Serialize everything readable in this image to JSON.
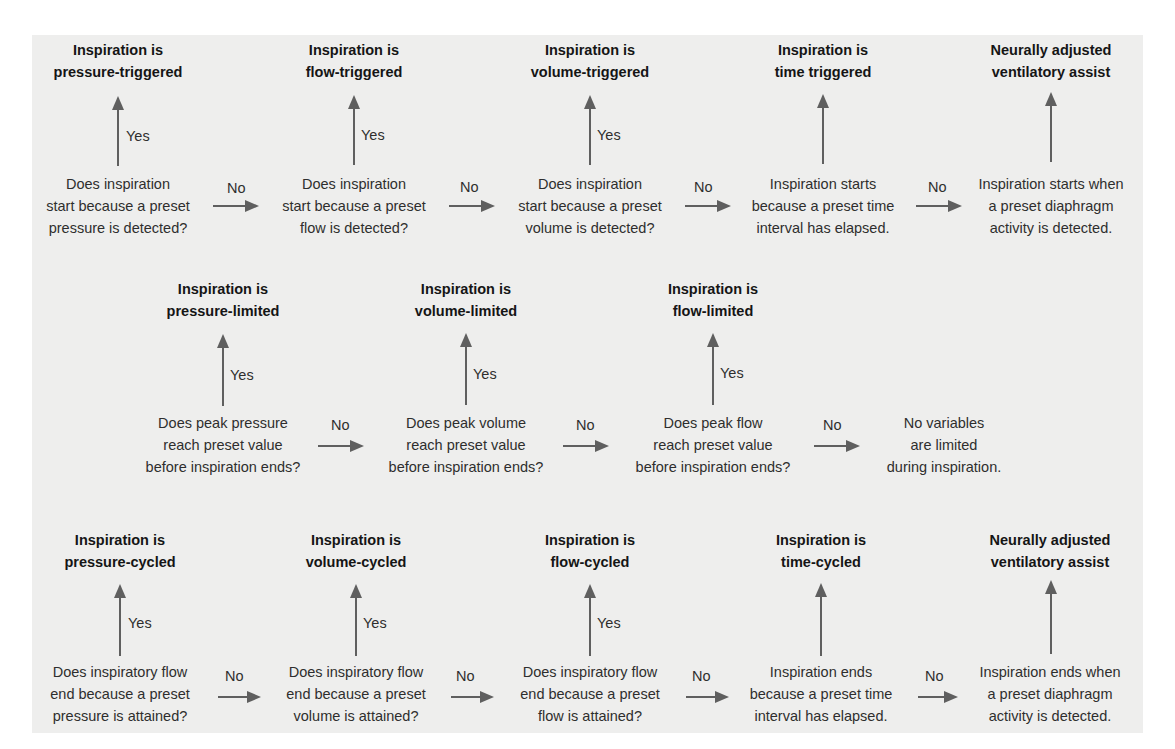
{
  "colors": {
    "panel_bg": "#eeeeed",
    "arrow": "#5f5f5f",
    "heading_text": "#151515",
    "body_text": "#2e2e2e"
  },
  "labels": {
    "yes": "Yes",
    "no": "No"
  },
  "rows": [
    {
      "name": "trigger",
      "steps": [
        {
          "heading": [
            "Inspiration is",
            "pressure-triggered"
          ],
          "question": [
            "Does inspiration",
            "start because a preset",
            "pressure is detected?"
          ],
          "yes_label": true
        },
        {
          "heading": [
            "Inspiration is",
            "flow-triggered"
          ],
          "question": [
            "Does inspiration",
            "start because a preset",
            "flow is detected?"
          ],
          "yes_label": true
        },
        {
          "heading": [
            "Inspiration is",
            "volume-triggered"
          ],
          "question": [
            "Does inspiration",
            "start because a preset",
            "volume is detected?"
          ],
          "yes_label": true
        },
        {
          "heading": [
            "Inspiration is",
            "time triggered"
          ],
          "question": [
            "Inspiration starts",
            "because a preset time",
            "interval has elapsed."
          ],
          "yes_label": false
        },
        {
          "heading": [
            "Neurally adjusted",
            "ventilatory assist"
          ],
          "question": [
            "Inspiration starts when",
            "a preset diaphragm",
            "activity is detected."
          ],
          "yes_label": false
        }
      ]
    },
    {
      "name": "limit",
      "steps": [
        {
          "heading": [
            "Inspiration is",
            "pressure-limited"
          ],
          "question": [
            "Does peak pressure",
            "reach preset value",
            "before inspiration ends?"
          ],
          "yes_label": true
        },
        {
          "heading": [
            "Inspiration is",
            "volume-limited"
          ],
          "question": [
            "Does peak volume",
            "reach preset value",
            "before inspiration ends?"
          ],
          "yes_label": true
        },
        {
          "heading": [
            "Inspiration is",
            "flow-limited"
          ],
          "question": [
            "Does peak flow",
            "reach preset value",
            "before inspiration ends?"
          ],
          "yes_label": true
        },
        {
          "heading": null,
          "question": [
            "No variables",
            "are limited",
            "during inspiration."
          ],
          "yes_label": false
        }
      ]
    },
    {
      "name": "cycle",
      "steps": [
        {
          "heading": [
            "Inspiration is",
            "pressure-cycled"
          ],
          "question": [
            "Does inspiratory flow",
            "end because a preset",
            "pressure is attained?"
          ],
          "yes_label": true
        },
        {
          "heading": [
            "Inspiration is",
            "volume-cycled"
          ],
          "question": [
            "Does inspiratory flow",
            "end because a preset",
            "volume is attained?"
          ],
          "yes_label": true
        },
        {
          "heading": [
            "Inspiration is",
            "flow-cycled"
          ],
          "question": [
            "Does inspiratory flow",
            "end because a preset",
            "flow is attained?"
          ],
          "yes_label": true
        },
        {
          "heading": [
            "Inspiration is",
            "time-cycled"
          ],
          "question": [
            "Inspiration ends",
            "because a preset time",
            "interval has elapsed."
          ],
          "yes_label": false
        },
        {
          "heading": [
            "Neurally adjusted",
            "ventilatory assist"
          ],
          "question": [
            "Inspiration ends when",
            "a preset diaphragm",
            "activity is detected."
          ],
          "yes_label": false
        }
      ]
    }
  ]
}
